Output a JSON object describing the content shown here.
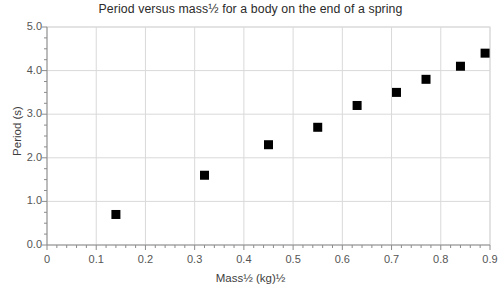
{
  "chart_data": {
    "type": "scatter",
    "title": "Period versus mass½ for a body on the end of a spring",
    "title_plain": "Period versus mass^(1/2) for a body on the end of a spring",
    "xlabel": "Mass½  (kg)½",
    "ylabel": "Period (s)",
    "xlim": [
      0,
      0.9
    ],
    "ylim": [
      0,
      5.0
    ],
    "xticks": [
      "0",
      "0.1",
      "0.2",
      "0.3",
      "0.4",
      "0.5",
      "0.6",
      "0.7",
      "0.8",
      "0.9"
    ],
    "xtick_values": [
      0,
      0.1,
      0.2,
      0.3,
      0.4,
      0.5,
      0.6,
      0.7,
      0.8,
      0.9
    ],
    "yticks": [
      "0.0",
      "1.0",
      "2.0",
      "3.0",
      "4.0",
      "5.0"
    ],
    "ytick_values": [
      0,
      1,
      2,
      3,
      4,
      5
    ],
    "x_minor_tick_step": 0.02,
    "y_minor_tick_step": 0.25,
    "grid": true,
    "grid_color": "#d9d9d9",
    "legend": null,
    "marker": "square",
    "marker_color": "#000000",
    "marker_size_px": 9,
    "x": [
      0.14,
      0.32,
      0.45,
      0.55,
      0.63,
      0.71,
      0.77,
      0.84,
      0.89
    ],
    "y": [
      0.7,
      1.6,
      2.3,
      2.7,
      3.2,
      3.5,
      3.8,
      4.1,
      4.4
    ],
    "points": [
      {
        "x": 0.14,
        "y": 0.7
      },
      {
        "x": 0.32,
        "y": 1.6
      },
      {
        "x": 0.45,
        "y": 2.3
      },
      {
        "x": 0.55,
        "y": 2.7
      },
      {
        "x": 0.63,
        "y": 3.2
      },
      {
        "x": 0.71,
        "y": 3.5
      },
      {
        "x": 0.77,
        "y": 3.8
      },
      {
        "x": 0.84,
        "y": 4.1
      },
      {
        "x": 0.89,
        "y": 4.4
      }
    ]
  },
  "plot_area": {
    "left": 47,
    "right": 490,
    "top": 27,
    "bottom": 245,
    "border_color": "#d9d9d9",
    "background": "#ffffff"
  }
}
